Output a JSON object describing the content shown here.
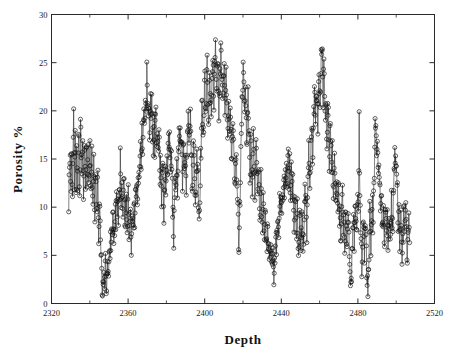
{
  "figure": {
    "background_color": "#ffffff",
    "frame_color": "#2a2a2a",
    "data_color": "#111111"
  },
  "axes": {
    "x_label": "Depth",
    "y_label": "Porosity %",
    "x_ticklabels": [
      "2320",
      "2360",
      "2400",
      "2440",
      "2480",
      "2520"
    ],
    "y_ticklabels": [
      "0",
      "5",
      "10",
      "15",
      "20",
      "25",
      "30"
    ]
  },
  "chart_data": {
    "type": "line",
    "title": "",
    "subtitle": "",
    "xlabel": "Depth",
    "ylabel": "Porosity %",
    "xlim": [
      2320,
      2520
    ],
    "ylim": [
      0,
      30
    ],
    "xticks": [
      2320,
      2360,
      2400,
      2440,
      2480,
      2520
    ],
    "yticks": [
      0,
      5,
      10,
      15,
      20,
      25,
      30
    ],
    "x_minor_ticks_between": 1,
    "grid": false,
    "legend": null,
    "legend_position": "none",
    "marker": "circle-open",
    "marker_size": 3.2,
    "line_width": 0.55,
    "series": [
      {
        "name": "porosity",
        "x_start": 2329.0,
        "x_end": 2507.0,
        "x_step": 0.2,
        "values": [
          9.0,
          11.4,
          13.7,
          12.2,
          14.5,
          16.3,
          13.1,
          11.6,
          15.2,
          17.0,
          14.3,
          12.1,
          10.5,
          13.4,
          16.1,
          21.2,
          17.4,
          14.0,
          12.6,
          15.5,
          18.4,
          16.0,
          13.2,
          11.0,
          14.8,
          16.9,
          15.1,
          12.4,
          10.8,
          13.9,
          16.5,
          19.1,
          15.8,
          13.0,
          11.5,
          14.2,
          17.2,
          22.6,
          18.1,
          15.0,
          13.3,
          11.8,
          14.6,
          16.8,
          15.4,
          12.9,
          11.2,
          13.6,
          15.9,
          17.5,
          14.9,
          12.3,
          10.6,
          13.1,
          15.6,
          16.7,
          14.1,
          12.0,
          13.8,
          15.3,
          16.2,
          14.4,
          12.7,
          11.1,
          13.5,
          15.0,
          16.4,
          14.7,
          12.5,
          10.9,
          12.8,
          14.2,
          15.7,
          13.4,
          11.7,
          10.1,
          12.2,
          13.9,
          15.1,
          13.0,
          11.3,
          9.8,
          11.6,
          13.2,
          14.5,
          12.6,
          10.4,
          8.9,
          10.2,
          11.8,
          13.1,
          11.0,
          9.2,
          7.7,
          8.6,
          10.0,
          11.5,
          9.6,
          7.9,
          6.4,
          5.1,
          4.2,
          3.4,
          2.6,
          1.9,
          1.5,
          2.2,
          3.0,
          3.8,
          2.9,
          2.1,
          1.6,
          2.4,
          3.3,
          4.1,
          3.2,
          2.5,
          1.8,
          2.7,
          3.6,
          4.5,
          3.7,
          2.8,
          2.0,
          2.3,
          3.1,
          4.0,
          4.9,
          5.8,
          6.7,
          7.5,
          6.9,
          6.1,
          7.0,
          7.9,
          8.7,
          7.6,
          8.4,
          9.2,
          8.1,
          7.3,
          8.0,
          8.8,
          9.5,
          10.3,
          9.4,
          8.5,
          9.9,
          11.1,
          10.0,
          9.1,
          10.6,
          11.9,
          10.8,
          9.7,
          11.2,
          12.4,
          11.3,
          10.2,
          11.7,
          15.2,
          13.1,
          11.5,
          10.3,
          11.8,
          13.3,
          12.1,
          10.7,
          9.3,
          10.5,
          11.9,
          13.4,
          12.2,
          10.9,
          9.5,
          8.2,
          9.4,
          10.8,
          12.0,
          10.6,
          9.2,
          7.8,
          8.9,
          10.1,
          11.4,
          10.0,
          8.6,
          7.4,
          8.3,
          9.6,
          10.9,
          9.5,
          8.1,
          6.9,
          5.7,
          6.6,
          7.8,
          9.0,
          10.2,
          9.1,
          8.0,
          9.3,
          10.5,
          11.6,
          10.4,
          9.2,
          10.4,
          11.7,
          12.9,
          11.8,
          10.6,
          11.9,
          13.2,
          12.0,
          10.8,
          12.1,
          13.5,
          14.8,
          13.6,
          12.3,
          13.7,
          15.0,
          16.3,
          15.1,
          13.8,
          15.2,
          16.5,
          17.8,
          16.6,
          15.3,
          16.7,
          18.0,
          19.3,
          20.6,
          19.4,
          18.1,
          19.5,
          20.8,
          22.1,
          20.9,
          19.6,
          21.0,
          23.9,
          24.8,
          22.5,
          20.3,
          18.9,
          20.1,
          21.4,
          20.0,
          18.6,
          17.2,
          18.5,
          19.8,
          21.1,
          19.7,
          18.3,
          19.6,
          20.9,
          19.5,
          18.2,
          16.8,
          15.4,
          16.7,
          18.1,
          19.4,
          18.0,
          16.6,
          17.9,
          19.2,
          20.2,
          18.8,
          17.4,
          16.0,
          17.3,
          18.6,
          17.2,
          15.8,
          14.4,
          15.7,
          17.0,
          15.6,
          14.2,
          12.8,
          14.1,
          15.4,
          14.0,
          12.6,
          11.2,
          12.5,
          13.8,
          15.1,
          13.7,
          12.3,
          10.9,
          9.2,
          10.4,
          11.7,
          13.0,
          14.3,
          13.1,
          11.8,
          13.2,
          14.5,
          15.8,
          14.6,
          13.3,
          14.7,
          16.0,
          17.3,
          16.1,
          14.8,
          16.2,
          17.5,
          16.3,
          15.0,
          13.6,
          14.9,
          16.2,
          15.0,
          13.6,
          12.2,
          10.8,
          9.4,
          8.0,
          6.4,
          7.6,
          8.9,
          10.2,
          11.5,
          12.8,
          11.6,
          10.3,
          11.7,
          13.0,
          14.3,
          13.1,
          11.8,
          13.2,
          14.5,
          15.8,
          17.1,
          18.4,
          17.2,
          15.9,
          17.3,
          18.6,
          17.4,
          16.1,
          17.5,
          16.2,
          14.9,
          13.6,
          12.3,
          13.7,
          15.0,
          16.3,
          15.1,
          13.8,
          15.2,
          16.5,
          15.3,
          14.0,
          12.7,
          11.4,
          12.8,
          14.1,
          15.4,
          16.7,
          18.0,
          19.3,
          20.1,
          18.7,
          17.3,
          15.9,
          17.2,
          18.5,
          19.8,
          18.4,
          17.0,
          15.6,
          14.2,
          12.8,
          11.4,
          13.1,
          14.4,
          15.7,
          17.0,
          16.0,
          14.6,
          13.2,
          11.8,
          10.4,
          9.2,
          10.7,
          12.0,
          13.3,
          14.6,
          15.9,
          14.7,
          13.4,
          12.0,
          10.6,
          9.3,
          8.1,
          9.5,
          10.8,
          12.1,
          13.4,
          14.7,
          16.0,
          17.3,
          18.6,
          19.9,
          21.2,
          20.0,
          18.6,
          17.2,
          18.5,
          19.8,
          21.1,
          22.4,
          23.7,
          22.5,
          21.1,
          19.7,
          20.1,
          21.4,
          22.7,
          24.0,
          23.6,
          22.2,
          20.8,
          19.4,
          20.7,
          22.0,
          23.3,
          24.6,
          23.4,
          22.0,
          20.6,
          19.2,
          20.5,
          21.8,
          23.1,
          24.4,
          25.7,
          24.5,
          23.1,
          21.7,
          20.3,
          21.6,
          22.9,
          24.2,
          25.5,
          26.8,
          25.6,
          24.2,
          22.8,
          21.4,
          22.7,
          24.0,
          25.3,
          24.1,
          22.7,
          21.3,
          20.0,
          21.3,
          22.6,
          23.9,
          25.2,
          26.5,
          28.6,
          26.0,
          24.6,
          23.2,
          21.8,
          20.4,
          21.7,
          23.0,
          24.3,
          25.6,
          24.4,
          23.0,
          21.6,
          20.2,
          21.5,
          22.8,
          24.1,
          22.9,
          21.5,
          20.1,
          18.7,
          17.3,
          18.6,
          19.9,
          21.2,
          20.0,
          18.6,
          17.2,
          18.5,
          19.8,
          18.4,
          17.0,
          15.6,
          14.2,
          15.5,
          16.8,
          18.1,
          19.4,
          18.2,
          16.8,
          15.4,
          14.0,
          12.6,
          11.2,
          12.5,
          13.8,
          15.1,
          16.4,
          15.2,
          13.8,
          12.4,
          11.0,
          10.4,
          9.0,
          7.6,
          6.1,
          7.4,
          8.7,
          10.0,
          11.3,
          12.6,
          13.9,
          15.2,
          16.5,
          17.8,
          19.1,
          20.4,
          21.7,
          23.0,
          24.3,
          24.9,
          23.5,
          22.1,
          20.7,
          19.3,
          20.6,
          21.9,
          20.7,
          19.3,
          17.9,
          16.5,
          17.8,
          19.1,
          20.4,
          21.5,
          20.3,
          18.9,
          17.5,
          16.1,
          14.7,
          13.3,
          14.6,
          15.9,
          17.2,
          16.0,
          14.6,
          13.2,
          11.8,
          13.1,
          14.4,
          15.7,
          17.0,
          15.8,
          14.4,
          13.0,
          11.6,
          12.9,
          14.2,
          15.5,
          16.8,
          15.6,
          14.2,
          12.8,
          11.4,
          10.0,
          11.3,
          12.6,
          13.9,
          12.7,
          11.3,
          9.9,
          8.5,
          9.8,
          11.1,
          12.4,
          11.2,
          9.8,
          8.4,
          7.0,
          8.3,
          9.6,
          10.9,
          9.7,
          8.3,
          6.9,
          7.2,
          8.5,
          9.8,
          8.6,
          7.2,
          6.0,
          6.8,
          7.1,
          6.5,
          7.3,
          8.1,
          7.4,
          6.6,
          5.8,
          5.0,
          4.4,
          3.9,
          4.5,
          5.3,
          6.1,
          5.4,
          4.6,
          3.8,
          3.1,
          3.5,
          4.3,
          5.1,
          4.3,
          3.5,
          2.8,
          3.2,
          4.0,
          4.8,
          5.6,
          6.4,
          7.2,
          6.5,
          5.7,
          6.3,
          7.1,
          7.9,
          8.7,
          9.5,
          8.8,
          8.0,
          8.9,
          9.7,
          10.5,
          9.8,
          9.0,
          10.1,
          11.0,
          10.2,
          9.4,
          10.5,
          11.4,
          12.3,
          11.5,
          10.7,
          11.8,
          12.9,
          12.1,
          11.3,
          12.4,
          13.5,
          12.7,
          11.9,
          13.0,
          14.1,
          13.3,
          12.5,
          13.6,
          14.7,
          16.6,
          15.2,
          13.8,
          12.4,
          13.7,
          15.0,
          14.2,
          12.8,
          11.4,
          12.7,
          14.0,
          13.2,
          11.8,
          10.4,
          11.7,
          13.0,
          12.2,
          10.8,
          9.4,
          8.0,
          9.3,
          10.6,
          11.9,
          10.7,
          9.3,
          7.9,
          6.5,
          7.8,
          9.1,
          10.4,
          9.2,
          7.8,
          6.4,
          5.0,
          6.3,
          7.6,
          8.9,
          7.7,
          6.3,
          4.9,
          5.3,
          6.6,
          7.9,
          9.2,
          10.5,
          9.3,
          7.9,
          6.5,
          5.1,
          6.4,
          7.7,
          9.0,
          10.3,
          11.6,
          12.9,
          11.7,
          10.3,
          8.9,
          7.5,
          8.8,
          10.1,
          11.4,
          12.7,
          14.0,
          15.3,
          16.6,
          15.4,
          14.0,
          12.6,
          13.9,
          15.2,
          16.5,
          17.8,
          18.7,
          17.3,
          15.9,
          14.5,
          15.8,
          17.1,
          18.4,
          19.7,
          21.0,
          21.8,
          20.4,
          19.0,
          17.6,
          18.9,
          20.2,
          21.5,
          22.8,
          21.6,
          20.2,
          18.8,
          20.1,
          21.4,
          22.7,
          24.0,
          22.8,
          21.4,
          20.0,
          21.3,
          22.6,
          23.9,
          25.2,
          26.5,
          27.0,
          25.6,
          24.2,
          22.8,
          21.4,
          22.7,
          24.0,
          23.6,
          22.2,
          20.8,
          19.4,
          20.7,
          22.0,
          20.8,
          19.4,
          18.0,
          16.6,
          17.9,
          19.2,
          20.5,
          19.3,
          17.9,
          16.5,
          15.1,
          16.4,
          17.7,
          19.0,
          17.8,
          16.4,
          15.0,
          13.6,
          14.9,
          16.2,
          15.0,
          13.6,
          12.2,
          10.8,
          12.1,
          13.4,
          14.7,
          13.5,
          12.1,
          10.7,
          9.3,
          10.6,
          11.9,
          13.2,
          12.0,
          10.6,
          9.2,
          10.5,
          11.8,
          10.6,
          9.2,
          7.8,
          9.1,
          10.4,
          9.2,
          7.8,
          6.4,
          7.7,
          9.0,
          10.3,
          11.6,
          10.4,
          9.0,
          7.6,
          8.9,
          10.2,
          9.0,
          7.6,
          6.2,
          7.5,
          8.8,
          10.1,
          8.9,
          7.5,
          6.1,
          4.7,
          5.9,
          7.2,
          8.5,
          9.8,
          8.6,
          7.2,
          5.8,
          4.4,
          3.0,
          2.2,
          1.6,
          0.8,
          2.1,
          3.4,
          4.7,
          6.0,
          7.3,
          8.6,
          9.9,
          8.7,
          7.3,
          5.9,
          7.2,
          8.5,
          9.8,
          11.1,
          9.9,
          8.5,
          7.1,
          8.4,
          9.7,
          11.0,
          12.3,
          11.1,
          9.7,
          8.3,
          20.9,
          17.5,
          12.9,
          11.5,
          10.1,
          8.7,
          7.3,
          5.9,
          4.5,
          3.1,
          4.4,
          5.7,
          7.0,
          8.3,
          9.6,
          8.4,
          7.0,
          5.6,
          6.9,
          8.2,
          9.5,
          8.3,
          6.9,
          5.5,
          4.1,
          2.9,
          1.5,
          0.6,
          1.9,
          3.2,
          4.5,
          5.8,
          7.1,
          8.4,
          9.7,
          8.5,
          7.1,
          5.7,
          7.0,
          8.3,
          9.6,
          10.9,
          9.7,
          8.3,
          9.6,
          10.9,
          12.2,
          13.5,
          14.8,
          16.1,
          17.4,
          18.7,
          19.0,
          17.6,
          16.2,
          14.8,
          16.1,
          17.4,
          16.2,
          14.8,
          13.4,
          12.0,
          13.3,
          14.6,
          13.4,
          12.0,
          10.6,
          9.2,
          10.5,
          11.8,
          10.6,
          9.2,
          7.8,
          6.4,
          7.7,
          9.0,
          10.3,
          9.1,
          7.7,
          6.3,
          7.6,
          8.9,
          10.2,
          9.0,
          7.6,
          6.2,
          7.5,
          8.8,
          10.1,
          8.9,
          7.5,
          6.1,
          7.4,
          8.7,
          10.0,
          8.8,
          7.4,
          6.0,
          7.3,
          8.6,
          9.9,
          11.2,
          10.0,
          8.6,
          7.2,
          8.5,
          9.8,
          11.1,
          12.4,
          13.7,
          15.0,
          15.2,
          15.0,
          14.8,
          15.1,
          14.9,
          15.0,
          14.0,
          12.6,
          11.2,
          9.8,
          8.4,
          7.0,
          8.3,
          9.6,
          8.4,
          7.0,
          5.6,
          6.9,
          8.2,
          9.5,
          8.3,
          6.9,
          5.5,
          4.1,
          5.4,
          6.7,
          8.0,
          9.3,
          10.6,
          9.4,
          8.0,
          6.6,
          7.9,
          9.2,
          10.5,
          9.3,
          7.9,
          6.5,
          5.1,
          3.9,
          5.2,
          6.5,
          7.8,
          9.1,
          7.9,
          6.5,
          5.3
        ]
      }
    ]
  }
}
